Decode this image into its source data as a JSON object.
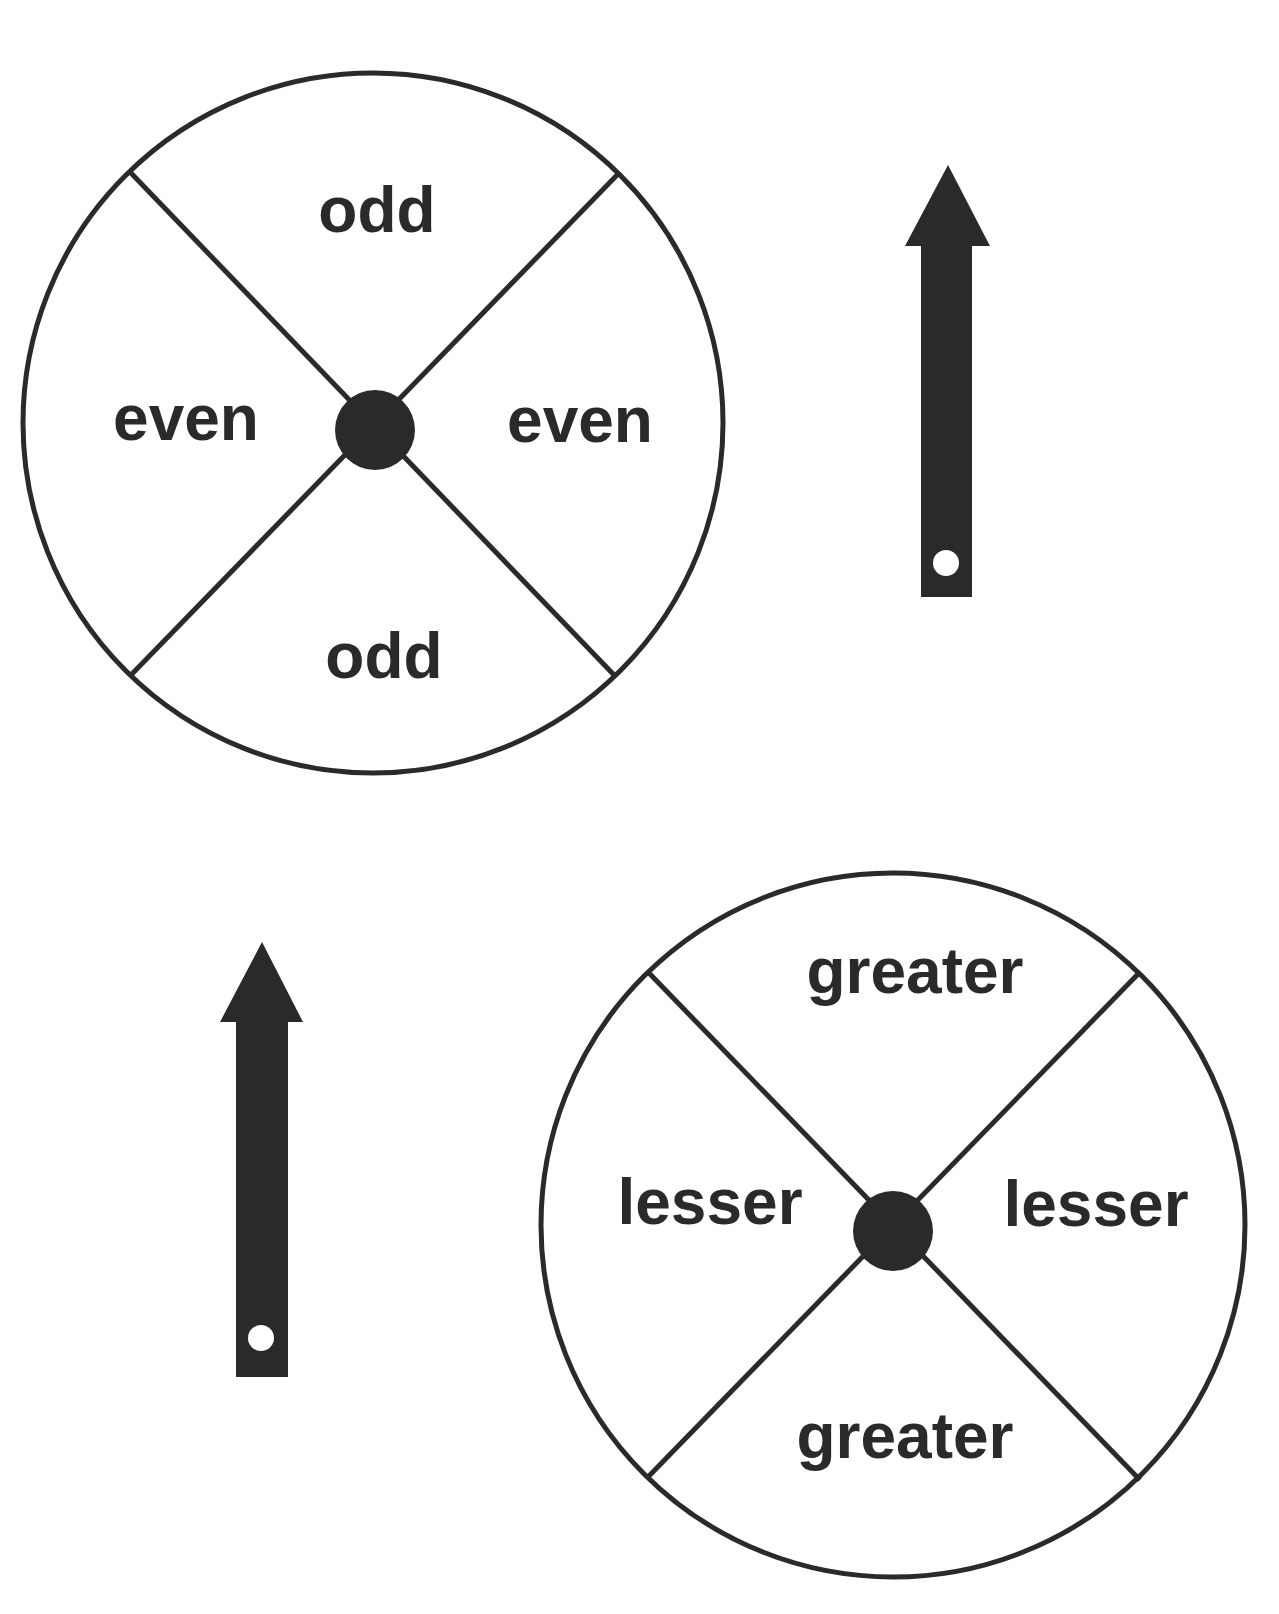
{
  "colors": {
    "ink": "#2a2a2a",
    "background": "#ffffff"
  },
  "spinners": [
    {
      "name": "odd-even-spinner",
      "labels": {
        "top": "odd",
        "left": "even",
        "right": "even",
        "bottom": "odd"
      }
    },
    {
      "name": "greater-lesser-spinner",
      "labels": {
        "top": "greater",
        "left": "lesser",
        "right": "lesser",
        "bottom": "greater"
      }
    }
  ],
  "arrows": [
    {
      "name": "arrow-pointer-1",
      "direction": "up"
    },
    {
      "name": "arrow-pointer-2",
      "direction": "up"
    }
  ]
}
